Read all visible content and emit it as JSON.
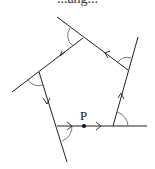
{
  "caption": {
    "text": "...ang..."
  },
  "diagram": {
    "point_label": "P",
    "shape": "pentagon",
    "vertices": [
      [
        57,
        126
      ],
      [
        113,
        126
      ],
      [
        128,
        70
      ],
      [
        83,
        38
      ],
      [
        39,
        72
      ]
    ],
    "extended_lines": [
      {
        "from": [
          57,
          126
        ],
        "to": [
          147,
          126
        ]
      },
      {
        "from": [
          113,
          126
        ],
        "to": [
          138,
          37
        ]
      },
      {
        "from": [
          128,
          70
        ],
        "to": [
          57,
          17
        ]
      },
      {
        "from": [
          83,
          38
        ],
        "to": [
          12,
          92
        ]
      },
      {
        "from": [
          39,
          72
        ],
        "to": [
          67,
          162
        ]
      }
    ],
    "point_p": [
      84,
      126
    ],
    "colors": {
      "line": "#222222",
      "arc": "#555555",
      "background": "#ffffff"
    }
  }
}
